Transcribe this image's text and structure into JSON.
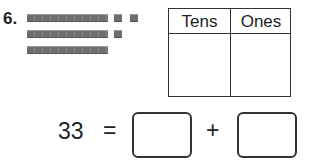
{
  "problem": {
    "number": "6.",
    "model": {
      "tens_rods": 3,
      "ones_cubes": 3,
      "icon_rod": "base-ten-rod",
      "icon_cube": "base-ten-unit-cube"
    },
    "place_value_table": {
      "headers": [
        "Tens",
        "Ones"
      ],
      "values": [
        "",
        ""
      ]
    },
    "equation": {
      "number": "33",
      "equals": "=",
      "plus": "+",
      "answer_1": "",
      "answer_2": ""
    }
  }
}
